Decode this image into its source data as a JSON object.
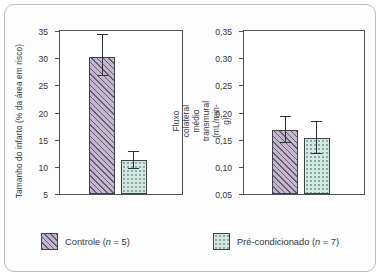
{
  "chart_data": [
    {
      "type": "bar",
      "id": "infarct-size",
      "title": "",
      "xlabel": "",
      "ylabel": "Tamanho do infarto (% da área em risco)",
      "ylim": [
        0,
        35
      ],
      "yticks": [
        5,
        10,
        15,
        20,
        25,
        30,
        35
      ],
      "ytick_labels": [
        "5",
        "10",
        "15",
        "20",
        "25",
        "30",
        "35"
      ],
      "grid": false,
      "categories": [
        "Controle",
        "Pré-condicionado"
      ],
      "values": [
        29.5,
        7.2
      ],
      "error_upper": [
        34.2,
        9.0
      ],
      "error_lower": [
        25.3,
        5.4
      ]
    },
    {
      "type": "bar",
      "id": "collateral-flow",
      "title": "",
      "xlabel": "",
      "ylabel": "Fluxo colateral médio transmural (mL/min-g)",
      "ylabel_line1": "Fluxo colateral médio transmural",
      "ylabel_line2": "(mL/min-g)",
      "ylim": [
        0,
        0.35
      ],
      "yticks": [
        0.05,
        0.1,
        0.15,
        0.2,
        0.25,
        0.3,
        0.35
      ],
      "ytick_labels": [
        "0,05",
        "0,10",
        "0,15",
        "0,20",
        "0,25",
        "0,30",
        "0,35"
      ],
      "grid": false,
      "categories": [
        "Controle",
        "Pré-condicionado"
      ],
      "values": [
        0.138,
        0.12
      ],
      "error_upper": [
        0.165,
        0.155
      ],
      "error_lower": [
        0.11,
        0.085
      ]
    }
  ],
  "panels": {
    "left": {
      "ytitle": "Tamanho do infarto (% da área em risco)",
      "ticks": [
        "35",
        "30",
        "25",
        "20",
        "15",
        "10",
        "5"
      ]
    },
    "right": {
      "ytitle_line1": "Fluxo colateral médio transmural",
      "ytitle_line2": "(mL/min-g)",
      "ticks": [
        "0,35",
        "0,30",
        "0,25",
        "0,20",
        "0,15",
        "0,10",
        "0,05"
      ]
    }
  },
  "legend": {
    "control": {
      "label": "Controle",
      "n_text": "(n = 5)",
      "n_symbol": "n",
      "n_value": "= 5)",
      "pattern": "diagonal-hatch",
      "color": "#c3b7cb"
    },
    "preconditioned": {
      "label": "Pré-condicionado",
      "n_text": "(n = 7)",
      "n_symbol": "n",
      "n_value": "= 7)",
      "pattern": "dotted",
      "color": "#d6e8e2"
    }
  },
  "style": {
    "axis_color": "#4c5358",
    "frame_color": "#b9bcc0",
    "text_color": "#2f363c",
    "background": "#ffffff"
  }
}
